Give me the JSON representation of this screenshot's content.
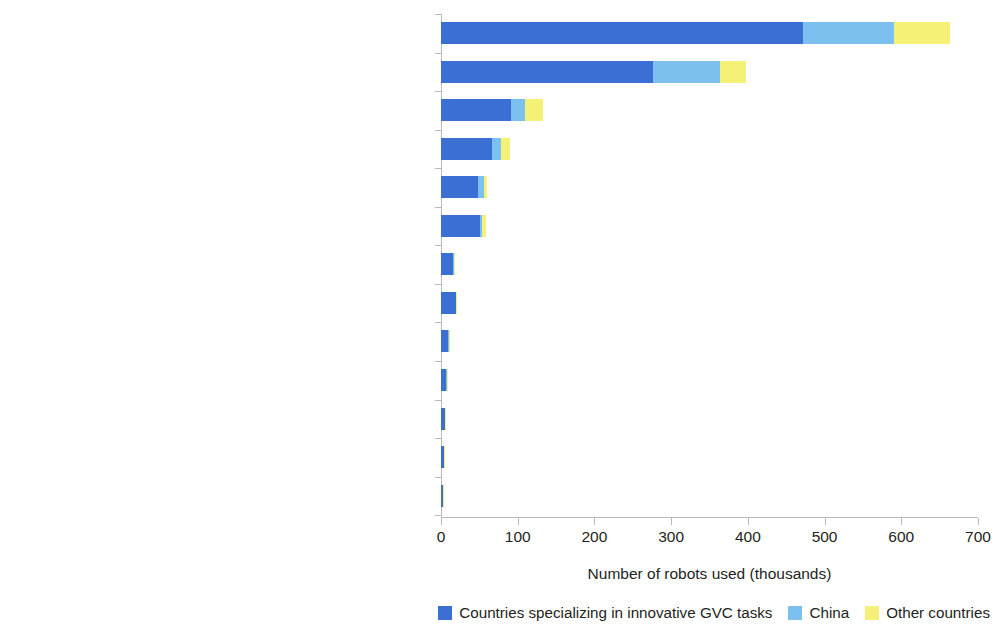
{
  "chart_data": {
    "type": "bar",
    "orientation": "horizontal",
    "stacked": true,
    "title": "",
    "xlabel": "Number of robots used (thousands)",
    "ylabel": "",
    "xlim": [
      0,
      700
    ],
    "xticks": [
      0,
      100,
      200,
      300,
      400,
      500,
      600,
      700
    ],
    "xtick_labels": [
      "0",
      "100",
      "200",
      "300",
      "400",
      "500",
      "600",
      "700"
    ],
    "grid": false,
    "legend_position": "bottom-right",
    "categories": [
      "Motor vehicles, trailers, and semitrailers",
      "Computer, electronic, and electrical equipment",
      "Rubber and plastic products",
      "Fabricated metal products",
      "Machinery and equipment, n.e.c.",
      "Food products, beverages, and tobacco",
      "Basic metals",
      "Petroleum, chemical, and pharmaceutical products",
      "Other nonmetallic mineral products",
      "Other transportation equipment",
      "Wood and products of wood and cork",
      "Paper products and printing",
      "Textiles, wearing apparel, leather and related"
    ],
    "series": [
      {
        "name": "Countries specializing in innovative GVC tasks",
        "color": "#3b6fd4",
        "values": [
          472,
          276,
          91,
          67,
          48,
          51,
          16,
          19,
          9,
          7,
          5,
          4,
          2
        ]
      },
      {
        "name": "China",
        "color": "#7cc0f0",
        "values": [
          119,
          88,
          19,
          11,
          8,
          2,
          1,
          1,
          1,
          1,
          0.5,
          0.5,
          0.3
        ]
      },
      {
        "name": "Other countries",
        "color": "#f5f177",
        "values": [
          73,
          33,
          23,
          12,
          4,
          6,
          1,
          1,
          0.5,
          0.5,
          0.3,
          0.3,
          0.2
        ]
      }
    ]
  },
  "legend": {
    "items": [
      {
        "label": "Countries specializing in innovative GVC tasks",
        "color": "#3b6fd4"
      },
      {
        "label": "China",
        "color": "#7cc0f0"
      },
      {
        "label": "Other countries",
        "color": "#f5f177"
      }
    ]
  }
}
